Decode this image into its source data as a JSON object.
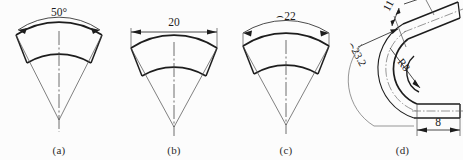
{
  "drawing": {
    "title": "Dimensioning methods for sector and bent-pipe parts",
    "background_color": "#fcfcfc",
    "line_color": "#1d1d1d",
    "thin_line_color": "#555555"
  },
  "figures": [
    {
      "id": "a",
      "caption": "(a)",
      "method": "angular-dimension",
      "dimension": {
        "value": "50",
        "symbol": "°",
        "label": "50°",
        "type": "angle",
        "line_style": "arc",
        "arrowheads": 2
      },
      "features": [
        "sector-outer-arc",
        "sector-inner-arc",
        "radial-lines",
        "apex-centerline"
      ]
    },
    {
      "id": "b",
      "caption": "(b)",
      "method": "chord-dimension",
      "dimension": {
        "value": "20",
        "symbol": "",
        "label": "20",
        "type": "chord",
        "line_style": "straight",
        "arrowheads": 2
      },
      "features": [
        "sector-outer-arc",
        "sector-inner-arc",
        "radial-lines",
        "apex-centerline"
      ]
    },
    {
      "id": "c",
      "caption": "(c)",
      "method": "arc-length-dimension",
      "dimension": {
        "value": "22",
        "symbol": "⌢",
        "label": "⌢22",
        "type": "arc-length",
        "line_style": "arc",
        "arrowheads": 2
      },
      "features": [
        "sector-outer-arc",
        "sector-inner-arc",
        "radial-lines",
        "apex-centerline"
      ]
    },
    {
      "id": "d",
      "caption": "(d)",
      "method": "bent-pipe-dimensions",
      "dimensions": [
        {
          "label": "11",
          "value": "11",
          "symbol": "",
          "type": "width",
          "location": "upper-arm",
          "arrowheads": 2
        },
        {
          "label": "⌢23.2",
          "value": "23.2",
          "symbol": "⌢",
          "type": "arc-length",
          "location": "outer-bend",
          "arrowheads": 1,
          "rotated": true
        },
        {
          "label": "R8",
          "value": "8",
          "symbol": "R",
          "type": "radius",
          "location": "inner-bend",
          "arrowheads": 1,
          "rotated": true
        },
        {
          "label": "8",
          "value": "8",
          "symbol": "",
          "type": "width",
          "location": "lower-arm",
          "arrowheads": 2
        }
      ],
      "features": [
        "u-bend-strip",
        "upper-arm-inclined",
        "lower-arm-horizontal",
        "bend-centerline"
      ]
    }
  ]
}
